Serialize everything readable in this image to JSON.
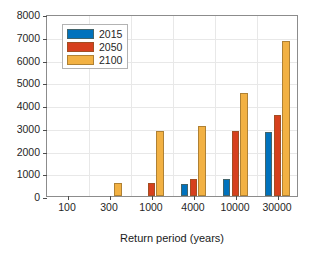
{
  "chart_data": {
    "type": "bar",
    "title": "",
    "xlabel": "Return period (years)",
    "ylabel": "Spill volume (m3)",
    "ylabel_base": "Spill volume (m",
    "ylabel_sup": "3",
    "ylabel_close": ")",
    "categories": [
      "100",
      "300",
      "1000",
      "4000",
      "10000",
      "30000"
    ],
    "series": [
      {
        "name": "2015",
        "color": "#0072BD",
        "values": [
          0,
          0,
          0,
          550,
          740,
          2830
        ]
      },
      {
        "name": "2050",
        "color": "#D6401E",
        "values": [
          0,
          0,
          560,
          760,
          2850,
          3540
        ]
      },
      {
        "name": "2100",
        "color": "#F2B143",
        "values": [
          0,
          570,
          2870,
          3080,
          4550,
          6800
        ]
      }
    ],
    "ylim": [
      0,
      8000
    ],
    "yticks": [
      0,
      1000,
      2000,
      3000,
      4000,
      5000,
      6000,
      7000,
      8000
    ],
    "ytick_labels": [
      "0",
      "1000",
      "2000",
      "3000",
      "4000",
      "5000",
      "6000",
      "7000",
      "8000"
    ],
    "grid": true,
    "legend_position": "upper left",
    "legend_entries": [
      "2015",
      "2050",
      "2100"
    ]
  },
  "legend": {
    "items": [
      {
        "label": "2015",
        "color": "#0072BD"
      },
      {
        "label": "2050",
        "color": "#D6401E"
      },
      {
        "label": "2100",
        "color": "#F2B143"
      }
    ]
  }
}
